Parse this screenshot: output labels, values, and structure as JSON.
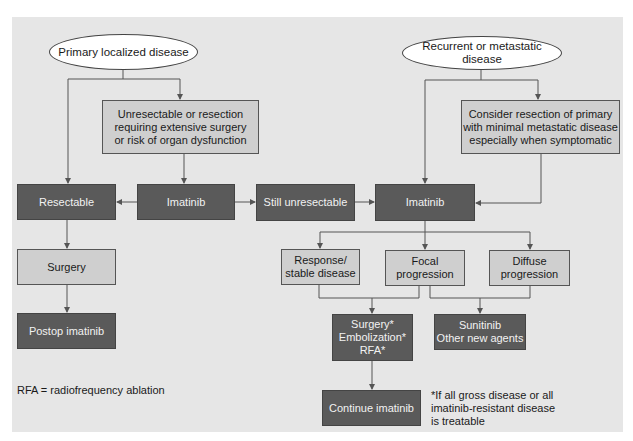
{
  "diagram": {
    "start_nodes": {
      "primary": "Primary localized disease",
      "recurrent": "Recurrent or metastatic disease"
    },
    "nodes": {
      "unresectable_condition": "Unresectable or resection\nrequiring extensive surgery\nor risk of organ dysfunction",
      "consider_resection": "Consider resection of primary\nwith minimal metastatic disease\nespecially when symptomatic",
      "resectable": "Resectable",
      "imatinib_left": "Imatinib",
      "still_unresectable": "Still unresectable",
      "imatinib_right": "Imatinib",
      "surgery": "Surgery",
      "postop_imatinib": "Postop imatinib",
      "response_stable": "Response/\nstable disease",
      "focal_progression": "Focal\nprogression",
      "diffuse_progression": "Diffuse\nprogression",
      "local_therapy": "Surgery*\nEmbolization*\nRFA*",
      "sunitinib": "Sunitinib\nOther new agents",
      "continue_imatinib": "Continue imatinib"
    },
    "notes": {
      "abbreviation": "RFA = radiofrequency ablation",
      "footnote": "*If all gross disease or all\nimatinib-resistant disease\nis treatable"
    },
    "edges": [
      {
        "from": "Primary localized disease",
        "to": "Resectable"
      },
      {
        "from": "Primary localized disease",
        "to": "Unresectable or resection requiring extensive surgery or risk of organ dysfunction"
      },
      {
        "from": "Unresectable or resection requiring extensive surgery or risk of organ dysfunction",
        "to": "Imatinib"
      },
      {
        "from": "Imatinib",
        "to": "Resectable"
      },
      {
        "from": "Imatinib",
        "to": "Still unresectable"
      },
      {
        "from": "Still unresectable",
        "to": "Imatinib (right)"
      },
      {
        "from": "Recurrent or metastatic disease",
        "to": "Imatinib (right)"
      },
      {
        "from": "Recurrent or metastatic disease",
        "to": "Consider resection of primary with minimal metastatic disease especially when symptomatic"
      },
      {
        "from": "Consider resection of primary with minimal metastatic disease especially when symptomatic",
        "to": "Imatinib (right)"
      },
      {
        "from": "Resectable",
        "to": "Surgery"
      },
      {
        "from": "Surgery",
        "to": "Postop imatinib"
      },
      {
        "from": "Imatinib (right)",
        "to": "Response/stable disease"
      },
      {
        "from": "Imatinib (right)",
        "to": "Focal progression"
      },
      {
        "from": "Imatinib (right)",
        "to": "Diffuse progression"
      },
      {
        "from": "Response/stable disease",
        "to": "Surgery*/Embolization*/RFA*"
      },
      {
        "from": "Focal progression",
        "to": "Surgery*/Embolization*/RFA*"
      },
      {
        "from": "Focal progression",
        "to": "Sunitinib/Other new agents"
      },
      {
        "from": "Diffuse progression",
        "to": "Sunitinib/Other new agents"
      },
      {
        "from": "Surgery*/Embolization*/RFA*",
        "to": "Continue imatinib"
      }
    ],
    "colors": {
      "panel": "#e6e6e6",
      "dark_box": "#5a5a5a",
      "light_box": "#cfcfcf",
      "ellipse": "#ffffff",
      "line": "#555555"
    }
  }
}
